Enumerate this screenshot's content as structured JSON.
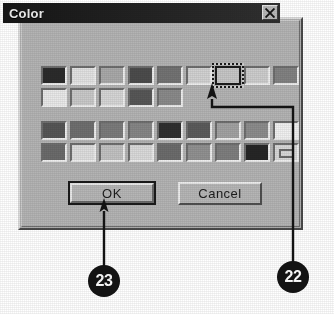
{
  "figure": {
    "caption_numbers": [
      "23",
      "22"
    ],
    "background_color": "#ffffff"
  },
  "dialog": {
    "title": "Color",
    "titlebar_color": "#1d1d1d",
    "face_color": "#b4b4b4",
    "close_button": {
      "icon": "close-icon",
      "label": "X"
    },
    "basic_colors": {
      "label": "Basic colors",
      "rows": [
        [
          {
            "name": "swatch-1-1",
            "color": "#2b2b2b"
          },
          {
            "name": "swatch-1-2",
            "color": "#e2e2e2"
          },
          {
            "name": "swatch-1-3",
            "color": "#a9a9a9"
          },
          {
            "name": "swatch-1-4",
            "color": "#4c4c4c"
          },
          {
            "name": "swatch-1-5",
            "color": "#737373"
          },
          {
            "name": "swatch-1-6",
            "color": "#d2d2d2"
          },
          {
            "name": "swatch-1-7",
            "color": "#c6c6c6",
            "selected": true
          },
          {
            "name": "swatch-1-8",
            "color": "#cdcdcd"
          },
          {
            "name": "swatch-1-9",
            "color": "#828282"
          }
        ],
        [
          {
            "name": "swatch-2-1",
            "color": "#e9e9e9"
          },
          {
            "name": "swatch-2-2",
            "color": "#c9c9c9"
          },
          {
            "name": "swatch-2-3",
            "color": "#d6d6d6"
          },
          {
            "name": "swatch-2-4",
            "color": "#575757"
          },
          {
            "name": "swatch-2-5",
            "color": "#8a8a8a"
          }
        ]
      ]
    },
    "custom_colors": {
      "label": "Custom colors",
      "rows": [
        [
          {
            "name": "swatch-3-1",
            "color": "#565656"
          },
          {
            "name": "swatch-3-2",
            "color": "#6f6f6f"
          },
          {
            "name": "swatch-3-3",
            "color": "#7b7b7b"
          },
          {
            "name": "swatch-3-4",
            "color": "#868686"
          },
          {
            "name": "swatch-3-5",
            "color": "#2f2f2f"
          },
          {
            "name": "swatch-3-6",
            "color": "#5b5b5b"
          },
          {
            "name": "swatch-3-7",
            "color": "#a2a2a2"
          },
          {
            "name": "swatch-3-8",
            "color": "#8c8c8c"
          },
          {
            "name": "swatch-3-9",
            "color": "#f1f1f1"
          }
        ],
        [
          {
            "name": "swatch-4-1",
            "color": "#6b6b6b"
          },
          {
            "name": "swatch-4-2",
            "color": "#dedede"
          },
          {
            "name": "swatch-4-3",
            "color": "#c2c2c2"
          },
          {
            "name": "swatch-4-4",
            "color": "#dadada"
          },
          {
            "name": "swatch-4-5",
            "color": "#6c6c6c"
          },
          {
            "name": "swatch-4-6",
            "color": "#919191"
          },
          {
            "name": "swatch-4-7",
            "color": "#7e7e7e"
          },
          {
            "name": "swatch-4-8",
            "color": "#262626"
          },
          {
            "name": "swatch-4-9",
            "color": "#d8d8d8",
            "empty": true
          }
        ]
      ]
    },
    "buttons": {
      "ok": "OK",
      "cancel": "Cancel"
    }
  },
  "annotations": [
    {
      "id": "callout-23",
      "number": "23",
      "points_to": "ok-button",
      "color": "#141414"
    },
    {
      "id": "callout-22",
      "number": "22",
      "points_to": "selected-color-swatch",
      "color": "#141414"
    }
  ]
}
